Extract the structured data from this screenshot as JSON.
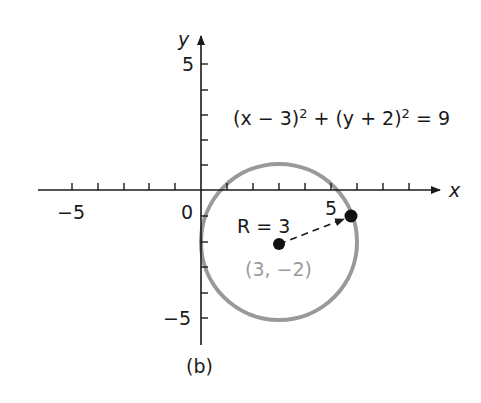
{
  "figure": {
    "caption": "(b)",
    "equation": "(x − 3)² + (y + 2)² = 9",
    "equation_parts": {
      "lhs1": "(x − 3)",
      "exp": "2",
      "plus": " + (y + 2)",
      "rhs": " = 9"
    },
    "axes": {
      "x_label": "x",
      "y_label": "y",
      "origin_label": "0",
      "x_tick_labels": {
        "neg5": "−5",
        "pos5": "5"
      },
      "y_tick_labels": {
        "pos5": "5",
        "neg5": "−5"
      },
      "x_range": [
        -5,
        9
      ],
      "y_range": [
        -6,
        6
      ],
      "tick_step": 1
    },
    "circle": {
      "center": [
        3,
        -2
      ],
      "radius": 3,
      "center_label": "(3, −2)",
      "radius_label": "R = 3",
      "stroke_color": "#999999"
    },
    "point_on_circle": [
      5.77,
      -0.96
    ],
    "colors": {
      "ink": "#1a1a1a",
      "circle": "#999999",
      "center_label": "#9a9a9a"
    }
  }
}
